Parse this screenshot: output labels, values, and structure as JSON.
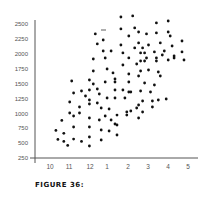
{
  "caption": "FIGURE 36:",
  "chart_data": {
    "type": "scatter",
    "title": "",
    "xlabel": "",
    "ylabel": "",
    "x_tick_labels": [
      "10",
      "11",
      "12",
      "1",
      "2",
      "3",
      "4",
      "5"
    ],
    "y_tick_labels": [
      "2500",
      "2250",
      "2000",
      "1750",
      "1500",
      "1250",
      "1000",
      "750",
      "500",
      "250"
    ],
    "ylim": [
      250,
      2500
    ],
    "xlim": [
      9.7,
      15.5
    ],
    "grid": false,
    "legend": null,
    "marker_color": "#111111",
    "axis_color": "#555555",
    "x_note": "x is a month index: 10=Oct, 11=Nov, 12=Dec, 13=Jan(1), 14=Feb(2), 15=Mar(3), 16=Apr(4), 17=May(5)",
    "points": [
      [
        10.3,
        714
      ],
      [
        10.4,
        563
      ],
      [
        10.6,
        882
      ],
      [
        10.7,
        664
      ],
      [
        10.7,
        529
      ],
      [
        10.9,
        462
      ],
      [
        11.0,
        1190
      ],
      [
        11.0,
        1006
      ],
      [
        11.1,
        1543
      ],
      [
        11.2,
        1341
      ],
      [
        11.2,
        955
      ],
      [
        11.2,
        770
      ],
      [
        11.2,
        568
      ],
      [
        11.5,
        1106
      ],
      [
        11.5,
        1006
      ],
      [
        11.6,
        1375
      ],
      [
        11.6,
        529
      ],
      [
        11.8,
        1291
      ],
      [
        12.0,
        1560
      ],
      [
        12.0,
        1392
      ],
      [
        12.0,
        1224
      ],
      [
        12.0,
        1157
      ],
      [
        12.0,
        922
      ],
      [
        12.0,
        770
      ],
      [
        12.0,
        602
      ],
      [
        12.0,
        451
      ],
      [
        12.2,
        1913
      ],
      [
        12.2,
        1711
      ],
      [
        12.2,
        1492
      ],
      [
        12.3,
        2333
      ],
      [
        12.4,
        2165
      ],
      [
        12.4,
        1409
      ],
      [
        12.4,
        1174
      ],
      [
        12.5,
        888
      ],
      [
        12.5,
        1325
      ],
      [
        12.6,
        1089
      ],
      [
        12.6,
        720
      ],
      [
        12.6,
        552
      ],
      [
        12.7,
        2232
      ],
      [
        12.7,
        2047
      ],
      [
        12.8,
        1929
      ],
      [
        12.8,
        1526
      ],
      [
        12.8,
        955
      ],
      [
        12.9,
        1744
      ],
      [
        12.9,
        1258
      ],
      [
        13.0,
        1073
      ],
      [
        13.0,
        703
      ],
      [
        13.1,
        888
      ],
      [
        13.1,
        2047
      ],
      [
        13.2,
        1678
      ],
      [
        13.3,
        1526
      ],
      [
        13.3,
        821
      ],
      [
        13.3,
        1577
      ],
      [
        13.3,
        1392
      ],
      [
        13.3,
        1258
      ],
      [
        13.4,
        804
      ],
      [
        13.4,
        636
      ],
      [
        13.4,
        971
      ],
      [
        13.6,
        2618
      ],
      [
        13.6,
        2417
      ],
      [
        13.6,
        2148
      ],
      [
        13.7,
        2014
      ],
      [
        13.7,
        1812
      ],
      [
        13.7,
        1392
      ],
      [
        13.8,
        1258
      ],
      [
        13.9,
        1022
      ],
      [
        13.9,
        971
      ],
      [
        14.0,
        2299
      ],
      [
        14.0,
        1661
      ],
      [
        14.0,
        1930
      ],
      [
        14.0,
        1526
      ],
      [
        14.0,
        1358
      ],
      [
        14.1,
        1039
      ],
      [
        14.1,
        1358
      ],
      [
        14.2,
        2635
      ],
      [
        14.3,
        2434
      ],
      [
        14.3,
        2098
      ],
      [
        14.4,
        1829
      ],
      [
        14.4,
        1090
      ],
      [
        14.5,
        1627
      ],
      [
        14.5,
        1140
      ],
      [
        14.5,
        922
      ],
      [
        14.5,
        2366
      ],
      [
        14.5,
        2182
      ],
      [
        14.6,
        1711
      ],
      [
        14.6,
        2014
      ],
      [
        14.6,
        1879
      ],
      [
        14.6,
        1375
      ],
      [
        14.7,
        1207
      ],
      [
        14.7,
        1022
      ],
      [
        14.7,
        2098
      ],
      [
        14.8,
        2014
      ],
      [
        14.8,
        1510
      ],
      [
        14.8,
        1879
      ],
      [
        14.9,
        2333
      ],
      [
        14.9,
        1929
      ],
      [
        15.0,
        1728
      ],
      [
        15.0,
        2148
      ],
      [
        15.1,
        1358
      ],
      [
        15.2,
        1207
      ],
      [
        15.2,
        1106
      ],
      [
        15.3,
        2031
      ],
      [
        15.3,
        1476
      ],
      [
        15.4,
        2518
      ],
      [
        15.4,
        2350
      ],
      [
        15.4,
        1879
      ],
      [
        15.4,
        1930
      ],
      [
        15.5,
        1694
      ],
      [
        15.5,
        1224
      ],
      [
        15.6,
        1627
      ],
      [
        15.6,
        2182
      ],
      [
        15.7,
        1980
      ],
      [
        15.8,
        2047
      ],
      [
        15.9,
        1241
      ],
      [
        16.0,
        2551
      ],
      [
        16.0,
        2366
      ],
      [
        16.0,
        1896
      ],
      [
        16.1,
        2299
      ],
      [
        16.2,
        2131
      ],
      [
        16.3,
        1963
      ],
      [
        16.3,
        1929
      ],
      [
        16.7,
        2215
      ],
      [
        16.7,
        2031
      ],
      [
        16.8,
        1896
      ]
    ]
  },
  "axes": {
    "y_ticks": [
      {
        "label": "2500",
        "y": 24
      },
      {
        "label": "2250",
        "y": 39
      },
      {
        "label": "2000",
        "y": 54
      },
      {
        "label": "1750",
        "y": 69
      },
      {
        "label": "1500",
        "y": 84
      },
      {
        "label": "1250",
        "y": 99
      },
      {
        "label": "1000",
        "y": 114
      },
      {
        "label": "750",
        "y": 128
      },
      {
        "label": "500",
        "y": 143
      },
      {
        "label": "250",
        "y": 158
      }
    ],
    "x_ticks": [
      {
        "label": "10",
        "x": 50
      },
      {
        "label": "11",
        "x": 69
      },
      {
        "label": "12",
        "x": 90
      },
      {
        "label": "1",
        "x": 107
      },
      {
        "label": "2",
        "x": 128
      },
      {
        "label": "3",
        "x": 148
      },
      {
        "label": "4",
        "x": 168
      },
      {
        "label": "5",
        "x": 188
      }
    ]
  },
  "plot_px": {
    "x0_val": 10,
    "x0_px": 50,
    "px_per_x": 19.7,
    "y0_val": 250,
    "y0_px": 158,
    "px_per_y": 0.05956
  }
}
